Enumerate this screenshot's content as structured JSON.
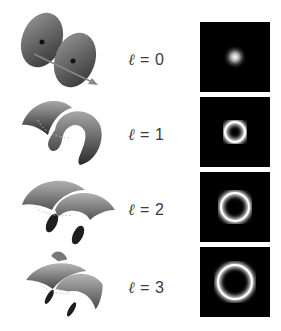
{
  "figure": {
    "rows": [
      {
        "ell_symbol": "ℓ",
        "equals": " = ",
        "value": "0",
        "wavefront": "planar-wavefront",
        "profile": "gaussian-spot",
        "ring_radius": 0
      },
      {
        "ell_symbol": "ℓ",
        "equals": " = ",
        "value": "1",
        "wavefront": "single-helix-wavefront",
        "profile": "donut-ring",
        "ring_radius": 10
      },
      {
        "ell_symbol": "ℓ",
        "equals": " = ",
        "value": "2",
        "wavefront": "double-helix-wavefront",
        "profile": "donut-ring",
        "ring_radius": 14
      },
      {
        "ell_symbol": "ℓ",
        "equals": " = ",
        "value": "3",
        "wavefront": "triple-helix-wavefront",
        "profile": "donut-ring",
        "ring_radius": 17
      }
    ],
    "colors": {
      "background": "#ffffff",
      "profile_background": "#000000",
      "label_text": "#3a3a3a",
      "surface_dark": "#2e2e2e",
      "surface_light": "#b8b8b8"
    }
  }
}
